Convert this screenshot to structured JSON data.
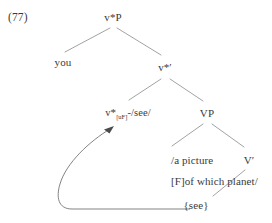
{
  "figure": {
    "example_number": "(77)",
    "type": "syntax-tree",
    "background_color": "#ffffff",
    "text_color": "#3a3a3a",
    "line_color": "#8a8a8a"
  },
  "tree": {
    "nodes": {
      "root_label": "v*P",
      "specifier_label": "you",
      "vbar_star_label": "v*′",
      "vstar_head": {
        "category": "v",
        "star": "*",
        "subscript": "[uF]",
        "separator": "-",
        "exponent": "/see/",
        "full_text": "v*[uF]-/see/"
      },
      "vp_label": "VP",
      "object_line1": "/a picture",
      "object_line2": "[F]of which planet/",
      "vbar_label": "V′",
      "copy_label": "{see}"
    }
  },
  "movement_arrow": {
    "from": "{see}",
    "to": "v*[uF]-/see/",
    "style": "curved-arrow-with-head"
  }
}
